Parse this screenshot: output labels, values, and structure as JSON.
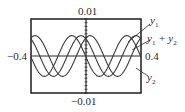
{
  "chart_data": {
    "type": "line",
    "title": "",
    "xlabel": "",
    "ylabel": "",
    "xlim": [
      -0.4,
      0.4
    ],
    "ylim": [
      -0.01,
      0.01
    ],
    "tick_labels": {
      "y_top": "0.01",
      "y_bottom": "-0.01",
      "x_left": "-0.4",
      "x_right": "0.4"
    },
    "grid": false,
    "series": [
      {
        "name": "y1",
        "label": "y",
        "sub": "1",
        "amplitude": 0.0055,
        "period": 0.4,
        "phase_deg": 0
      },
      {
        "name": "y2",
        "label": "y",
        "sub": "2",
        "amplitude": 0.0055,
        "period": 0.4,
        "phase_deg": 120
      },
      {
        "name": "y1 + y2",
        "label": "y",
        "sub": "1",
        "label_rest": " + y",
        "sub2": "2",
        "amplitude": 0.0055,
        "period": 0.4,
        "phase_deg": 60
      }
    ]
  },
  "labels": {
    "y_top": "0.01",
    "y_bottom": "−0.01",
    "x_left": "−0.4",
    "x_right": "0.4",
    "y1_main": "y",
    "y1_sub": "1",
    "sum_main1": "y",
    "sum_sub1": "1",
    "sum_plus": " + y",
    "sum_sub2": "2",
    "y2_main": "y",
    "y2_sub": "2"
  }
}
